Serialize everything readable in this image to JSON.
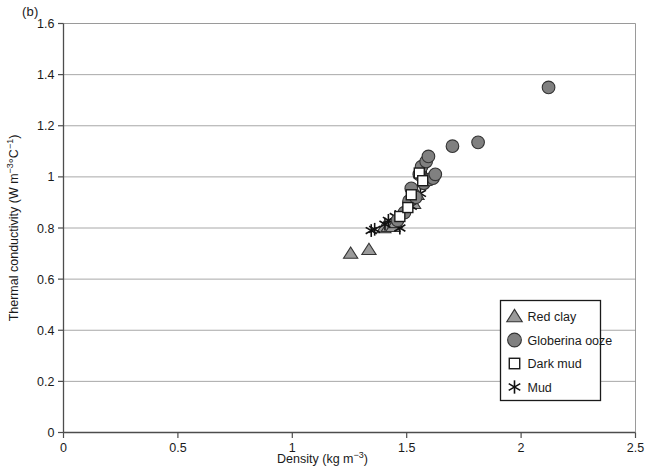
{
  "panel_label": "(b)",
  "axis_label_color": "#1a1a1a",
  "chart_data": {
    "type": "scatter",
    "title": "",
    "subtitle": "",
    "panel": "(b)",
    "xlabel": "Density (kg m-3)",
    "xlabel_base": "Density (kg m",
    "xlabel_exp": "−3",
    "xlabel_tail": ")",
    "ylabel": "Thermal conductivity (W m-3 degC-1)",
    "ylabel_p1": "Thermal conductivity (W m",
    "ylabel_e1": "−3",
    "ylabel_p2": "°C",
    "ylabel_e2": "−1",
    "ylabel_p3": ")",
    "xlim": [
      0,
      2.5
    ],
    "ylim": [
      0,
      1.6
    ],
    "xticks": [
      0,
      0.5,
      1,
      1.5,
      2,
      2.5
    ],
    "xtick_labels": [
      "0",
      "0.5",
      "1",
      "1.5",
      "2",
      "2.5"
    ],
    "yticks": [
      0,
      0.2,
      0.4,
      0.6,
      0.8,
      1.0,
      1.2,
      1.4,
      1.6
    ],
    "ytick_labels": [
      "0",
      "0.2",
      "0.4",
      "0.6",
      "0.8",
      "1",
      "1.2",
      "1.4",
      "1.6"
    ],
    "grid": {
      "horizontal": true,
      "vertical": false,
      "color": "#808080"
    },
    "legend": {
      "position": "bottom-right",
      "border": true
    },
    "series": [
      {
        "name": "Red clay",
        "marker": "triangle",
        "fill": "#9a9a9a",
        "edge": "#333333",
        "points": [
          [
            1.255,
            0.7
          ],
          [
            1.335,
            0.715
          ],
          [
            1.4,
            0.8
          ],
          [
            1.42,
            0.805
          ],
          [
            1.44,
            0.805
          ],
          [
            1.45,
            0.82
          ],
          [
            1.53,
            0.895
          ],
          [
            1.545,
            0.93
          ]
        ]
      },
      {
        "name": "Globerina ooze",
        "marker": "circle",
        "fill": "#808080",
        "edge": "#333333",
        "points": [
          [
            1.46,
            0.83
          ],
          [
            1.49,
            0.86
          ],
          [
            1.51,
            0.905
          ],
          [
            1.52,
            0.955
          ],
          [
            1.54,
            0.92
          ],
          [
            1.555,
            1.01
          ],
          [
            1.565,
            1.04
          ],
          [
            1.575,
            0.975
          ],
          [
            1.585,
            1.06
          ],
          [
            1.595,
            1.08
          ],
          [
            1.6,
            0.99
          ],
          [
            1.615,
            0.995
          ],
          [
            1.625,
            1.01
          ],
          [
            1.7,
            1.12
          ],
          [
            1.812,
            1.135
          ],
          [
            2.12,
            1.35
          ]
        ]
      },
      {
        "name": "Dark mud",
        "marker": "square",
        "fill": "#ffffff",
        "edge": "#1a1a1a",
        "points": [
          [
            1.47,
            0.845
          ],
          [
            1.505,
            0.88
          ],
          [
            1.52,
            0.93
          ],
          [
            1.555,
            1.015
          ],
          [
            1.57,
            0.985
          ]
        ]
      },
      {
        "name": "Mud",
        "marker": "asterisk",
        "fill": "#111111",
        "edge": "#111111",
        "points": [
          [
            1.345,
            0.79
          ],
          [
            1.36,
            0.795
          ],
          [
            1.405,
            0.815
          ],
          [
            1.42,
            0.83
          ],
          [
            1.45,
            0.845
          ],
          [
            1.47,
            0.8
          ],
          [
            1.52,
            0.885
          ],
          [
            1.56,
            0.935
          ],
          [
            1.585,
            1.005
          ]
        ]
      }
    ]
  }
}
